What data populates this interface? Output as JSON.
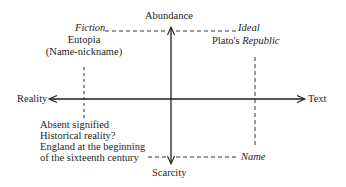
{
  "diagram": {
    "axes": {
      "vertical": {
        "top_label": "Abundance",
        "bottom_label": "Scarcity"
      },
      "horizontal": {
        "left_label": "Reality",
        "right_label": "Text"
      }
    },
    "top_left": {
      "corner_label": "Fiction",
      "title": "Eutopia",
      "subtitle": "(Name-nickname)"
    },
    "top_right": {
      "corner_label": "Ideal",
      "title_prefix": "Plato's",
      "title_italic": "Republic"
    },
    "bottom_left": {
      "lines": [
        "Absent signified",
        "Historical reality?",
        "England at the beginning",
        "of the sixteenth century"
      ]
    },
    "bottom_right": {
      "corner_label": "Name"
    },
    "colors": {
      "ink": "#1e1e1e",
      "background": "#ffffff"
    }
  }
}
